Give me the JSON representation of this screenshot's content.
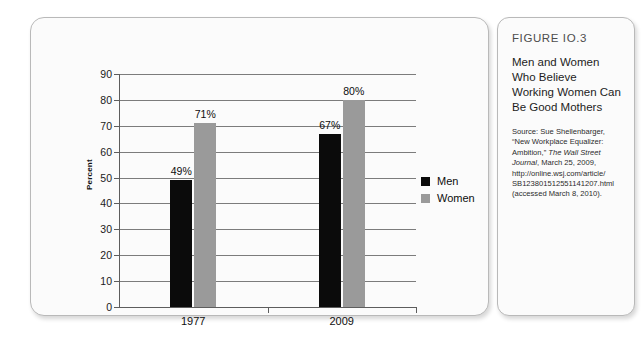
{
  "figure": {
    "number": "FIGURE IO.3",
    "title": "Men and Women Who Believe Working Women Can Be Good Mothers",
    "source_lines": [
      "Source: Sue Shellenbarger,",
      "“New Workplace Equalizer:",
      "Ambition,” ",
      "The Wall Street",
      "Journal",
      ", March 25, 2009,",
      "http://online.wsj.com/article/",
      "SB123801512551141207.html",
      "(accessed March 8, 2010)."
    ]
  },
  "chart_data": {
    "type": "bar",
    "title": "",
    "xlabel": "",
    "ylabel": "Percent",
    "ylim": [
      0,
      90
    ],
    "yticks": [
      0,
      10,
      20,
      30,
      40,
      50,
      60,
      70,
      80,
      90
    ],
    "ytick_labels": [
      "0",
      "10",
      "20",
      "30",
      "40",
      "50",
      "60",
      "70",
      "80",
      "90"
    ],
    "grid": true,
    "legend_position": "right",
    "categories": [
      "1977",
      "2009"
    ],
    "series": [
      {
        "name": "Men",
        "color": "#0b0b0b",
        "values": [
          49,
          67
        ],
        "data_labels": [
          "49%",
          "67%"
        ]
      },
      {
        "name": "Women",
        "color": "#9a9a9a",
        "values": [
          71,
          80
        ],
        "data_labels": [
          "71%",
          "80%"
        ]
      }
    ]
  }
}
